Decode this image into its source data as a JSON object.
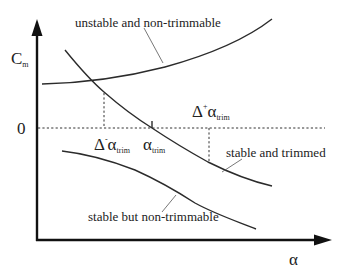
{
  "diagram": {
    "axes": {
      "y_label_main": "C",
      "y_label_sub": "m",
      "x_label": "α",
      "zero_label": "0"
    },
    "curves": [
      {
        "id": "unstable",
        "label": "unstable and non-trimmable",
        "slope": "positive"
      },
      {
        "id": "stable-trimmed",
        "label": "stable and trimmed",
        "slope": "negative"
      },
      {
        "id": "stable-nontrim",
        "label": "stable but non-trimmable",
        "slope": "negative"
      }
    ],
    "annotations": {
      "alpha_trim_main": "α",
      "alpha_trim_sub": "trim",
      "delta_minus_delta": "Δ",
      "delta_minus_sign": "-",
      "delta_minus_alpha": "α",
      "delta_minus_sub": "trim",
      "delta_plus_delta": "Δ",
      "delta_plus_sign": "+",
      "delta_plus_alpha": "α",
      "delta_plus_sub": "trim"
    },
    "colors": {
      "line": "#2b2b2b",
      "axis": "#111111",
      "background": "#ffffff"
    }
  }
}
